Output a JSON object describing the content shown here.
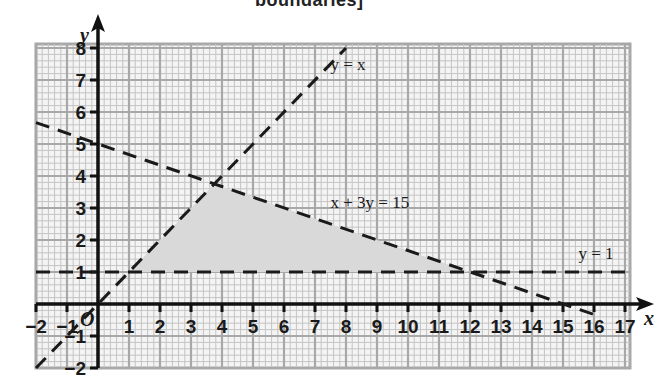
{
  "header": {
    "cut_title": "boundaries]"
  },
  "chart_data": {
    "type": "line",
    "title": "",
    "xlabel": "x",
    "ylabel": "y",
    "origin_label": "O",
    "xlim": [
      -2,
      17
    ],
    "ylim": [
      -2,
      8
    ],
    "grid": true,
    "x_ticks": [
      "-2",
      "-1",
      "1",
      "2",
      "3",
      "4",
      "5",
      "6",
      "7",
      "8",
      "9",
      "10",
      "11",
      "12",
      "13",
      "14",
      "15",
      "16",
      "17"
    ],
    "y_ticks": [
      "-2",
      "-1",
      "1",
      "2",
      "3",
      "4",
      "5",
      "6",
      "7",
      "8"
    ],
    "series": [
      {
        "name": "y = x",
        "style": "dashed",
        "points": [
          [
            -2,
            -2
          ],
          [
            8,
            8
          ]
        ]
      },
      {
        "name": "x + 3y = 15",
        "style": "dashed",
        "points": [
          [
            -2,
            5.67
          ],
          [
            16,
            -0.33
          ]
        ]
      },
      {
        "name": "y = 1",
        "style": "dashed",
        "points": [
          [
            -2,
            1
          ],
          [
            17,
            1
          ]
        ]
      }
    ],
    "shaded_region": {
      "description": "feasible region bounded by y = x, x + 3y = 15 and y = 1",
      "vertices": [
        [
          1,
          1
        ],
        [
          3.75,
          3.75
        ],
        [
          12,
          1
        ]
      ],
      "color": "#d9d9d9"
    },
    "annotations": [
      {
        "text": "y = x",
        "x": 7.5,
        "y": 7.3
      },
      {
        "text": "x + 3y = 15",
        "x": 7.5,
        "y": 3
      },
      {
        "text": "y = 1",
        "x": 15.5,
        "y": 1.4
      }
    ]
  },
  "colors": {
    "grid_minor": "#c4c4c4",
    "grid_major": "#a8a8a8",
    "axis": "#111111",
    "shade": "#d9d9d9"
  }
}
